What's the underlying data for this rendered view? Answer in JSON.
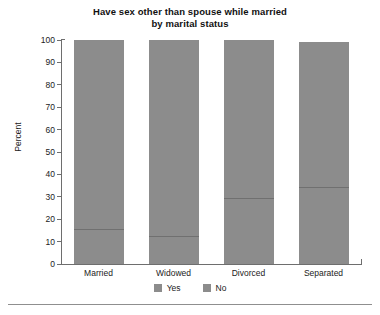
{
  "chart_data": {
    "type": "bar",
    "subtype": "stacked-100-percent",
    "title": "Have sex other than spouse while married\nby marital status",
    "title_lines": [
      "Have sex other than spouse while married",
      "by marital status"
    ],
    "xlabel": "",
    "ylabel": "Percent",
    "ylim": [
      0,
      100
    ],
    "yticks": [
      0,
      10,
      20,
      30,
      40,
      50,
      60,
      70,
      80,
      90,
      100
    ],
    "ytick_labels": [
      "0",
      "10",
      "20",
      "30",
      "40",
      "50",
      "60",
      "70",
      "80",
      "90",
      "100"
    ],
    "grid": false,
    "legend_position": "bottom-center",
    "categories": [
      "Married",
      "Widowed",
      "Divorced",
      "Separated"
    ],
    "series": [
      {
        "name": "Yes",
        "color": "#8c8c8c",
        "values": [
          15.6,
          12.5,
          29.5,
          34.4
        ]
      },
      {
        "name": "No",
        "color": "#8c8c8c",
        "values": [
          84.4,
          87.5,
          70.5,
          65.6
        ]
      }
    ],
    "bar_totals": [
      100,
      100,
      100,
      99
    ],
    "annotations": []
  },
  "axis": {
    "y_title": "Percent"
  },
  "legend": {
    "items": [
      {
        "label": "Yes",
        "color": "#8c8c8c"
      },
      {
        "label": "No",
        "color": "#8c8c8c"
      }
    ]
  },
  "colors": {
    "bar_fill": "#8c8c8c",
    "bar_divider": "#707070",
    "axis": "#6e6e6e",
    "text": "#222222",
    "background": "#ffffff",
    "rule": "#8f8f8f"
  }
}
